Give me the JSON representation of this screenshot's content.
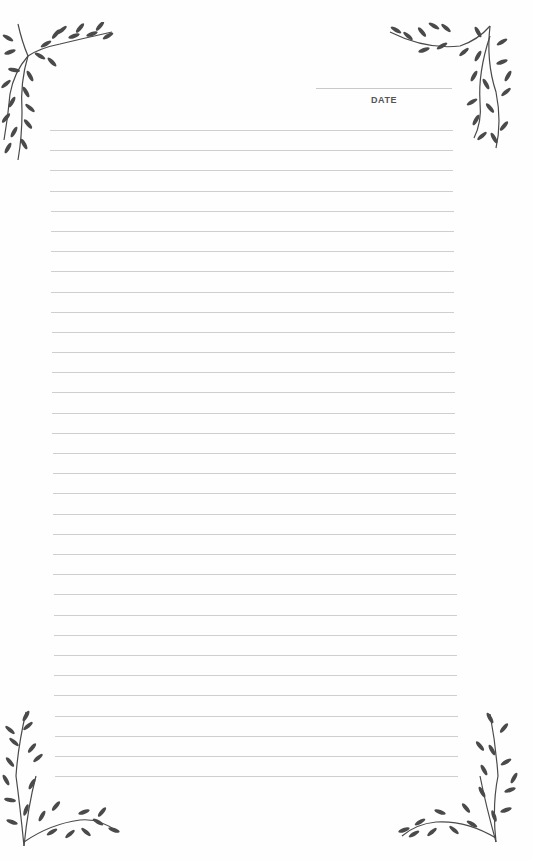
{
  "header": {
    "date_label": "DATE"
  },
  "ruled_lines": {
    "count": 33,
    "first_y": 130,
    "spacing": 20.19,
    "left_x": 50,
    "right_x": 453,
    "color": "#cfcfcf"
  },
  "decorations": {
    "vine_color": "#4a4a4a",
    "corners": [
      "top-left-vine-icon",
      "top-right-vine-icon",
      "bottom-left-vine-icon",
      "bottom-right-vine-icon"
    ]
  }
}
